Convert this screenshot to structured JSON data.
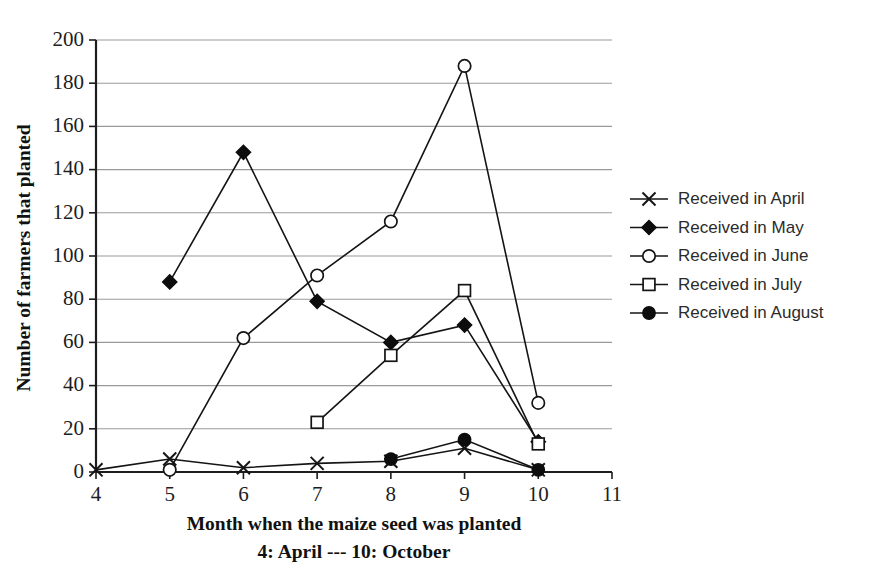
{
  "chart_data": {
    "type": "line",
    "title": "",
    "xlabel": "Month when the maize seed was planted",
    "xlabel_sub": "4: April --- 10: October",
    "ylabel": "Number of farmers that planted",
    "xlim": [
      4,
      11
    ],
    "ylim": [
      0,
      200
    ],
    "xticks": [
      4,
      5,
      6,
      7,
      8,
      9,
      10,
      11
    ],
    "yticks": [
      0,
      20,
      40,
      60,
      80,
      100,
      120,
      140,
      160,
      180,
      200
    ],
    "grid": "horizontal",
    "legend_position": "right",
    "series": [
      {
        "name": "Received in April",
        "marker": "x",
        "x": [
          4,
          5,
          6,
          7,
          8,
          9,
          10
        ],
        "values": [
          1,
          6,
          2,
          4,
          5,
          11,
          1
        ]
      },
      {
        "name": "Received in May",
        "marker": "filled-diamond",
        "x": [
          5,
          6,
          7,
          8,
          9,
          10
        ],
        "values": [
          88,
          148,
          79,
          60,
          68,
          14
        ]
      },
      {
        "name": "Received in June",
        "marker": "open-circle",
        "x": [
          5,
          6,
          7,
          8,
          9,
          10
        ],
        "values": [
          1,
          62,
          91,
          116,
          188,
          32
        ]
      },
      {
        "name": "Received in July",
        "marker": "open-square",
        "x": [
          7,
          8,
          9,
          10
        ],
        "values": [
          23,
          54,
          84,
          13
        ]
      },
      {
        "name": "Received in August",
        "marker": "filled-circle",
        "x": [
          8,
          9,
          10
        ],
        "values": [
          6,
          15,
          1
        ]
      }
    ]
  },
  "legend": {
    "items": [
      {
        "label": "Received in April",
        "marker": "x"
      },
      {
        "label": "Received in May",
        "marker": "filled-diamond"
      },
      {
        "label": "Received in June",
        "marker": "open-circle"
      },
      {
        "label": "Received in July",
        "marker": "open-square"
      },
      {
        "label": "Received in August",
        "marker": "filled-circle"
      }
    ]
  },
  "colors": {
    "ink": "#141414",
    "grid": "#9a9a9a",
    "background": "#ffffff"
  }
}
